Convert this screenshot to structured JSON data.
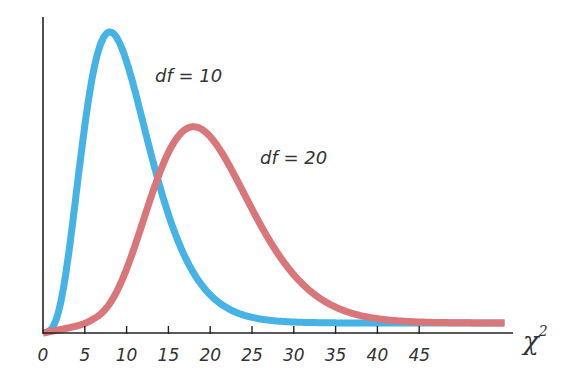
{
  "chart_data": {
    "type": "line",
    "title": "",
    "xlabel": "χ²",
    "ylabel": "",
    "xlim": [
      0,
      55
    ],
    "x_ticks": [
      0,
      5,
      10,
      15,
      20,
      25,
      30,
      35,
      40,
      45
    ],
    "x_tick_labels": [
      "0",
      "5",
      "10",
      "15",
      "20",
      "25",
      "30",
      "35",
      "40",
      "45"
    ],
    "y_ticks": [],
    "grid": false,
    "legend": "inline labels next to curves",
    "series": [
      {
        "name": "df = 10",
        "label": "df = 10",
        "df": 10,
        "color": "#45b3e6",
        "mode_x": 8,
        "description": "Chi-square density with 10 degrees of freedom"
      },
      {
        "name": "df = 20",
        "label": "df = 20",
        "df": 20,
        "color": "#d9767a",
        "mode_x": 18,
        "description": "Chi-square density with 20 degrees of freedom"
      }
    ]
  },
  "labels": {
    "df10": "df = 10",
    "df20": "df = 20",
    "x_axis_symbol": "χ",
    "x_axis_superscript": "2"
  }
}
